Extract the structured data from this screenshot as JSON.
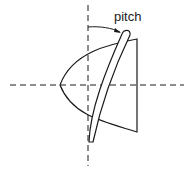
{
  "diagram": {
    "label_pitch": "pitch",
    "colors": {
      "stroke": "#1a1a1a",
      "background": "#ffffff"
    },
    "elements": [
      "vertical-dashed-axis",
      "horizontal-dashed-axis",
      "paraboloid-shape",
      "curved-blade",
      "pitch-angle-arc-arrow"
    ]
  }
}
